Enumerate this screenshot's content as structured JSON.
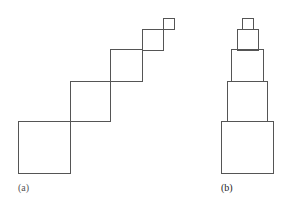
{
  "colors": {
    "stroke": "#555555",
    "background": "#ffffff"
  },
  "figures": [
    {
      "id": "a",
      "caption": "(a)",
      "arrangement": "diagonal-staircase",
      "squares": [
        {
          "x": 18,
          "y": 121,
          "size": 52
        },
        {
          "x": 70,
          "y": 81,
          "size": 40
        },
        {
          "x": 110,
          "y": 49,
          "size": 32
        },
        {
          "x": 142,
          "y": 29,
          "size": 21
        },
        {
          "x": 163,
          "y": 18,
          "size": 11
        }
      ]
    },
    {
      "id": "b",
      "caption": "(b)",
      "arrangement": "centered-stack",
      "squares": [
        {
          "x": 221,
          "y": 121,
          "size": 52
        },
        {
          "x": 227,
          "y": 81,
          "size": 40
        },
        {
          "x": 231,
          "y": 49,
          "size": 32
        },
        {
          "x": 237,
          "y": 29,
          "size": 21
        },
        {
          "x": 242,
          "y": 18,
          "size": 11
        }
      ]
    }
  ]
}
